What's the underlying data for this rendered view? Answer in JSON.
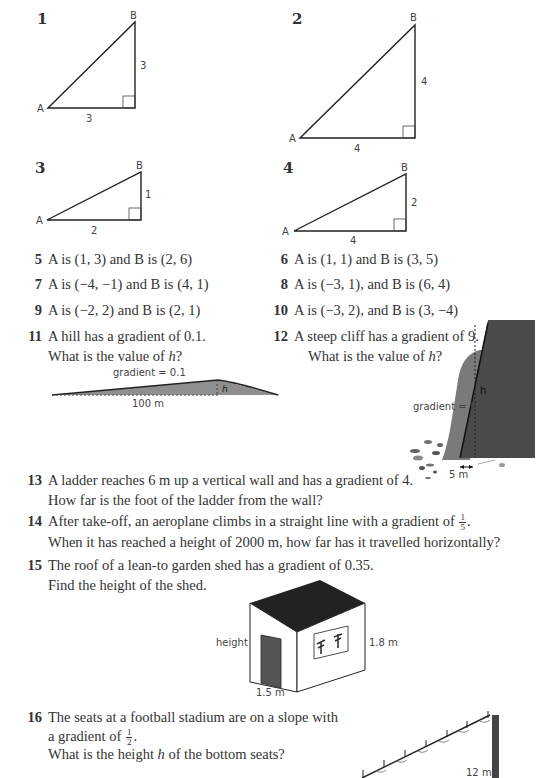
{
  "triangles": [
    {
      "num": "1",
      "labelA": "A",
      "labelB": "B",
      "base": "3",
      "height": "3"
    },
    {
      "num": "2",
      "labelA": "A",
      "labelB": "B",
      "base": "4",
      "height": "4"
    },
    {
      "num": "3",
      "labelA": "A",
      "labelB": "B",
      "base": "2",
      "height": "1"
    },
    {
      "num": "4",
      "labelA": "A",
      "labelB": "B",
      "base": "4",
      "height": "2"
    }
  ],
  "coordinate_questions": [
    {
      "num": "5",
      "text": "A is (1, 3) and B is (2, 6)"
    },
    {
      "num": "6",
      "text": "A is (1, 1) and B is (3, 5)"
    },
    {
      "num": "7",
      "text": "A is (−4, −1) and B is (4, 1)"
    },
    {
      "num": "8",
      "text": "A is (−3, 1), and B is (6, 4)"
    },
    {
      "num": "9",
      "text": "A is (−2, 2) and B is (2, 1)"
    },
    {
      "num": "10",
      "text": "A is (−3, 2), and B is (3, −4)"
    }
  ],
  "q11": {
    "num": "11",
    "line1": "A hill has a gradient of 0.1.",
    "line2_pre": "What is the value of ",
    "line2_var": "h",
    "line2_post": "?",
    "diagram": {
      "gradient_label": "gradient = 0.1",
      "h_label": "h",
      "base_label": "100 m"
    }
  },
  "q12": {
    "num": "12",
    "line1": "A steep cliff has a gradient of 9.",
    "line2_pre": "What is the value of ",
    "line2_var": "h",
    "line2_post": "?",
    "diagram": {
      "gradient_label": "gradient = 9",
      "h_label": "h",
      "base_label": "5 m"
    }
  },
  "q13": {
    "num": "13",
    "line1": "A ladder reaches 6 m up a vertical wall and has a gradient of 4.",
    "line2": "How far is the foot of the ladder from the wall?"
  },
  "q14": {
    "num": "14",
    "line1_pre": "After take-off, an aeroplane climbs in a straight line with a gradient of ",
    "frac_num": "1",
    "frac_den": "5",
    "line1_post": ".",
    "line2": "When it has reached a height of 2000 m, how far has it travelled horizontally?"
  },
  "q15": {
    "num": "15",
    "line1": "The roof of a lean-to garden shed has a gradient of 0.35.",
    "line2": "Find the height of the shed.",
    "diagram": {
      "height_label": "height",
      "right_label": "1.8 m",
      "base_label": "1.5 m"
    }
  },
  "q16": {
    "num": "16",
    "line1": "The seats at a football stadium are on a slope with",
    "line2_pre": "a gradient of ",
    "frac_num": "1",
    "frac_den": "2",
    "line2_post": ".",
    "line3_pre": "What is the height ",
    "line3_var": "h",
    "line3_post": " of the bottom seats?",
    "diagram": {
      "height_label": "12 m"
    }
  },
  "colors": {
    "text": "#333333",
    "shade": "#8a8a8a",
    "dark": "#4a4a4a",
    "line": "#222222"
  }
}
